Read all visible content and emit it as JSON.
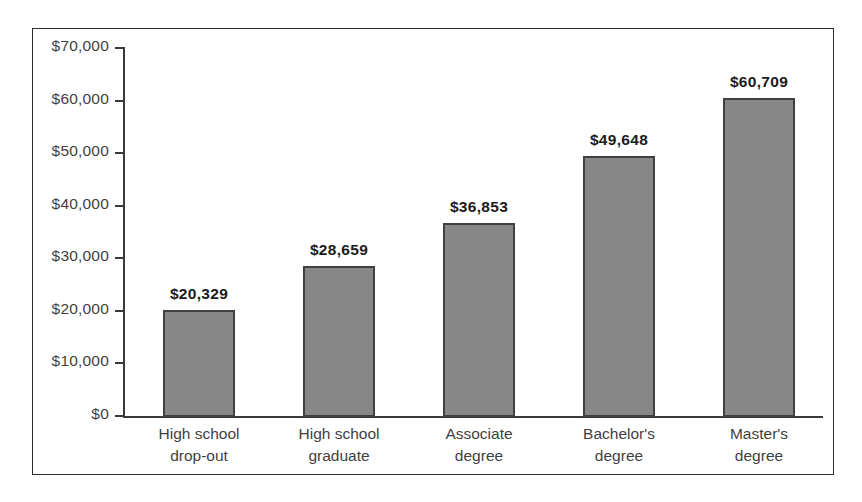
{
  "chart_data": {
    "type": "bar",
    "title": "",
    "subtitle": "",
    "xlabel": "",
    "ylabel": "",
    "categories": [
      "High school drop-out",
      "High school graduate",
      "Associate degree",
      "Bachelor's degree",
      "Master's degree"
    ],
    "category_lines": [
      [
        "High school",
        "drop-out"
      ],
      [
        "High school",
        "graduate"
      ],
      [
        "Associate",
        "degree"
      ],
      [
        "Bachelor's",
        "degree"
      ],
      [
        "Master's",
        "degree"
      ]
    ],
    "values": [
      20329,
      28659,
      36853,
      49648,
      60709
    ],
    "value_labels": [
      "$20,329",
      "$28,659",
      "$36,853",
      "$49,648",
      "$60,709"
    ],
    "ylim": [
      0,
      70000
    ],
    "ytick_values": [
      70000,
      60000,
      50000,
      40000,
      30000,
      20000,
      10000,
      0
    ],
    "ytick_labels": [
      "$70,000",
      "$60,000",
      "$50,000",
      "$40,000",
      "$30,000",
      "$20,000",
      "$10,000",
      "$0"
    ],
    "grid": false,
    "legend": null,
    "bar_fill_color": "#878787",
    "bar_border_color": "#404040",
    "axis_color": "#3a3a3a",
    "text_color": "#3f3f3f",
    "value_label_color": "#1c1c1c",
    "frame_color": "#2b2b2b",
    "background_color": "#ffffff"
  }
}
